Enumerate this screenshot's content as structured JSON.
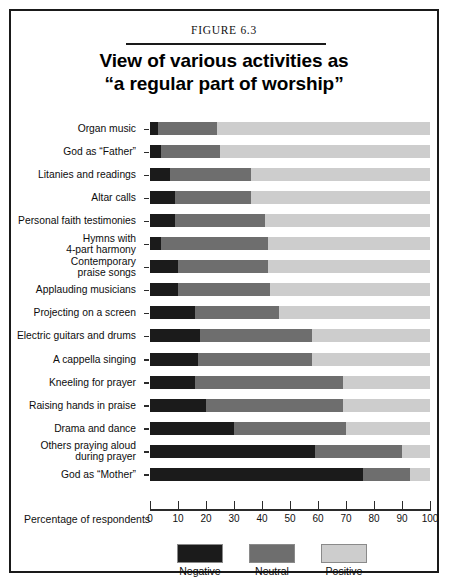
{
  "figure": {
    "label": "FIGURE 6.3",
    "title_line1": "View of various activities as",
    "title_line2": "“a regular part of worship”"
  },
  "axis": {
    "caption": "Percentage of respondents",
    "ticks": [
      "0",
      "10",
      "20",
      "30",
      "40",
      "50",
      "60",
      "70",
      "80",
      "90",
      "100"
    ]
  },
  "legend": {
    "items": [
      {
        "label": "Negative",
        "color": "#1b1b1b"
      },
      {
        "label": "Neutral",
        "color": "#6e6e6e"
      },
      {
        "label": "Positive",
        "color": "#cdcdcd"
      }
    ]
  },
  "chart_data": {
    "type": "bar",
    "orientation": "horizontal",
    "stacked": true,
    "title": "View of various activities as “a regular part of worship”",
    "xlabel": "Percentage of respondents",
    "ylabel": "",
    "xlim": [
      0,
      100
    ],
    "grid": false,
    "legend_position": "bottom",
    "categories": [
      "Organ music",
      "God as “Father”",
      "Litanies and readings",
      "Altar calls",
      "Personal faith testimonies",
      "Hymns with\n4-part harmony",
      "Contemporary\npraise songs",
      "Applauding musicians",
      "Projecting on a screen",
      "Electric guitars and drums",
      "A cappella singing",
      "Kneeling for prayer",
      "Raising hands in praise",
      "Drama and dance",
      "Others praying aloud\nduring prayer",
      "God as “Mother”"
    ],
    "series": [
      {
        "name": "Negative",
        "color": "#1b1b1b",
        "values": [
          3,
          4,
          7,
          9,
          9,
          4,
          10,
          10,
          16,
          18,
          17,
          16,
          20,
          30,
          59,
          76
        ]
      },
      {
        "name": "Neutral",
        "color": "#6e6e6e",
        "values": [
          21,
          21,
          29,
          27,
          32,
          38,
          32,
          33,
          30,
          40,
          41,
          53,
          49,
          40,
          31,
          17
        ]
      },
      {
        "name": "Positive",
        "color": "#cdcdcd",
        "values": [
          76,
          75,
          64,
          64,
          59,
          58,
          58,
          57,
          54,
          42,
          42,
          31,
          31,
          30,
          10,
          7
        ]
      }
    ]
  }
}
